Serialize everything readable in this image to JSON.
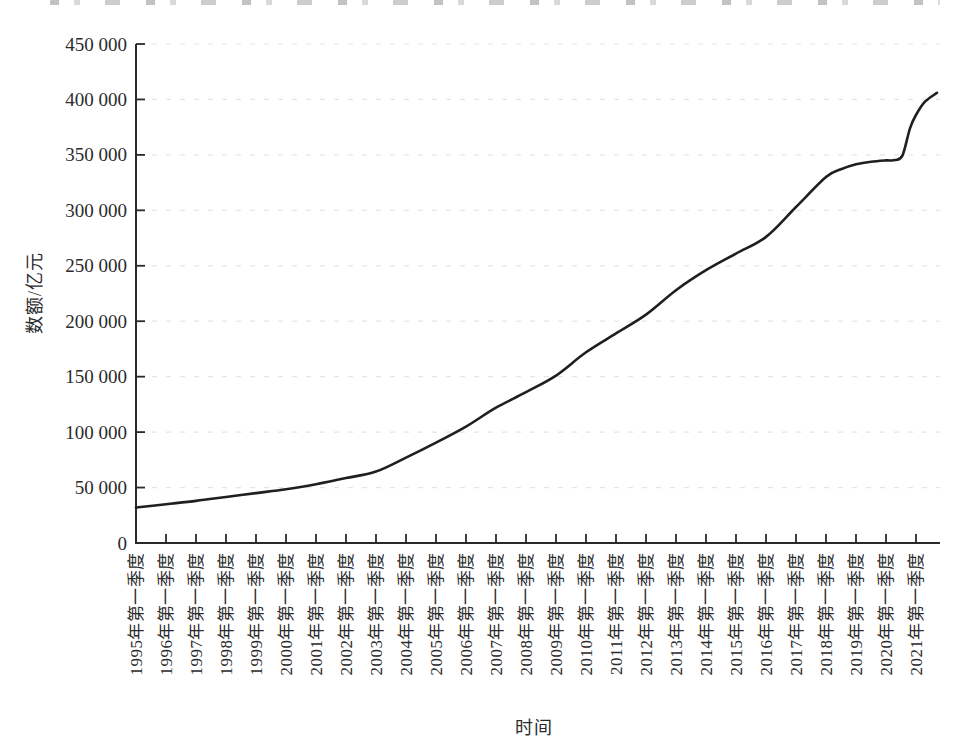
{
  "chart_data": {
    "type": "line",
    "title": "",
    "xlabel": "时间",
    "ylabel": "数额/亿元",
    "x_tick_labels": [
      "1995年第一季度",
      "1996年第一季度",
      "1997年第一季度",
      "1998年第一季度",
      "1999年第一季度",
      "2000年第一季度",
      "2001年第一季度",
      "2002年第一季度",
      "2003年第一季度",
      "2004年第一季度",
      "2005年第一季度",
      "2006年第一季度",
      "2007年第一季度",
      "2008年第一季度",
      "2009年第一季度",
      "2010年第一季度",
      "2011年第一季度",
      "2012年第一季度",
      "2013年第一季度",
      "2014年第一季度",
      "2015年第一季度",
      "2016年第一季度",
      "2017年第一季度",
      "2018年第一季度",
      "2019年第一季度",
      "2020年第一季度",
      "2021年第一季度"
    ],
    "x_tick_years": [
      1995,
      1996,
      1997,
      1998,
      1999,
      2000,
      2001,
      2002,
      2003,
      2004,
      2005,
      2006,
      2007,
      2008,
      2009,
      2010,
      2011,
      2012,
      2013,
      2014,
      2015,
      2016,
      2017,
      2018,
      2019,
      2020,
      2021
    ],
    "y_tick_values": [
      0,
      50000,
      100000,
      150000,
      200000,
      250000,
      300000,
      350000,
      400000,
      450000
    ],
    "y_tick_labels": [
      "0",
      "50 000",
      "100 000",
      "150 000",
      "200 000",
      "250 000",
      "300 000",
      "350 000",
      "400 000",
      "450 000"
    ],
    "ylim": [
      0,
      450000
    ],
    "xlim_years": [
      1995,
      2021.8
    ],
    "grid": "faint-dashed-horizontal",
    "legend": "none",
    "line_color": "#1f1f1f",
    "axis_color": "#2a2a2a",
    "series": [
      {
        "name": "",
        "points": [
          [
            1995,
            32000
          ],
          [
            1996,
            35000
          ],
          [
            1997,
            38000
          ],
          [
            1998,
            41500
          ],
          [
            1999,
            45000
          ],
          [
            2000,
            48500
          ],
          [
            2001,
            53000
          ],
          [
            2002,
            58500
          ],
          [
            2003,
            64500
          ],
          [
            2004,
            77000
          ],
          [
            2005,
            90500
          ],
          [
            2006,
            105000
          ],
          [
            2007,
            122000
          ],
          [
            2008,
            136000
          ],
          [
            2009,
            151000
          ],
          [
            2010,
            172000
          ],
          [
            2011,
            189000
          ],
          [
            2012,
            206000
          ],
          [
            2013,
            228000
          ],
          [
            2014,
            246000
          ],
          [
            2015,
            261000
          ],
          [
            2016,
            276000
          ],
          [
            2017,
            303000
          ],
          [
            2018,
            330000
          ],
          [
            2018.5,
            337000
          ],
          [
            2019,
            341500
          ],
          [
            2019.5,
            343800
          ],
          [
            2020,
            345000
          ],
          [
            2020.3,
            345300
          ],
          [
            2020.55,
            349500
          ],
          [
            2020.8,
            374000
          ],
          [
            2021,
            386000
          ],
          [
            2021.3,
            398000
          ],
          [
            2021.7,
            406000
          ]
        ]
      }
    ]
  }
}
